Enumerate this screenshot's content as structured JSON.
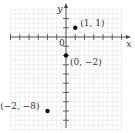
{
  "chart_data": {
    "type": "scatter",
    "title": "",
    "xlabel": "x",
    "ylabel": "y",
    "origin_label": "0",
    "xlim": [
      -6,
      6
    ],
    "ylim": [
      -10,
      3
    ],
    "grid": true,
    "points": [
      {
        "x": 1,
        "y": 1,
        "label": "(1, 1)"
      },
      {
        "x": 0,
        "y": -2,
        "label": "(0, −2)"
      },
      {
        "x": -2,
        "y": -8,
        "label": "(−2, −8)"
      }
    ]
  },
  "colors": {
    "grid": "#e6e6e6",
    "axis": "#444444",
    "point": "#111111",
    "text": "#333333"
  }
}
